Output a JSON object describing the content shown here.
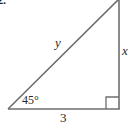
{
  "problem": {
    "number_label": "2."
  },
  "triangle": {
    "type": "right triangle",
    "stroke_color": "#6e6e6e",
    "hypotenuse_label": "y",
    "vertical_leg_label": "x",
    "base_label": "3",
    "angle_label": "45°",
    "right_angle_marker": true
  }
}
